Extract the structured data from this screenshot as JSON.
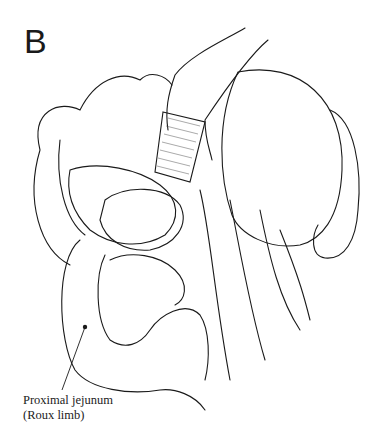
{
  "figure": {
    "panel_letter": "B",
    "labels": [
      {
        "line1": "Proximal jejunum",
        "line2": "(Roux limb)"
      }
    ],
    "colors": {
      "ink": "#1a1a1a",
      "background": "#ffffff",
      "hatch": "#555555"
    }
  }
}
